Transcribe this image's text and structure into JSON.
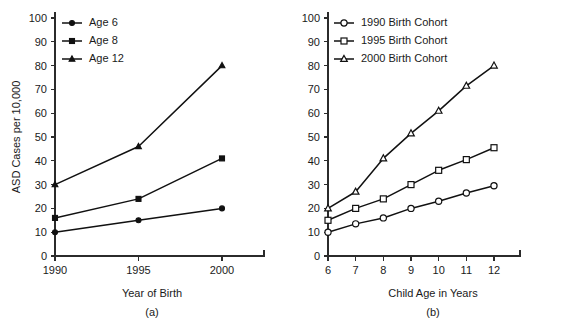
{
  "figure": {
    "background_color": "#ffffff",
    "ink_color": "#111111"
  },
  "chart_data": [
    {
      "type": "line",
      "panel": "a",
      "caption": "(a)",
      "title": "",
      "xlabel": "Year of Birth",
      "ylabel": "ASD Cases per 10,000",
      "x": [
        1990,
        1995,
        2000
      ],
      "categories": [
        "1990",
        "1995",
        "2000"
      ],
      "xtick_labels": [
        "1990",
        "1995",
        "2000"
      ],
      "ytick_labels": [
        "0",
        "10",
        "20",
        "30",
        "40",
        "50",
        "60",
        "70",
        "80",
        "90",
        "100"
      ],
      "ylim": [
        0,
        100
      ],
      "ytick_step": 10,
      "grid": false,
      "legend_position": "top-left",
      "series": [
        {
          "name": "Age 6",
          "marker": "filled-circle",
          "values": [
            10,
            15,
            20
          ]
        },
        {
          "name": "Age 8",
          "marker": "filled-square",
          "values": [
            16,
            24,
            41
          ]
        },
        {
          "name": "Age 12",
          "marker": "filled-triangle",
          "values": [
            30,
            46,
            80
          ]
        }
      ]
    },
    {
      "type": "line",
      "panel": "b",
      "caption": "(b)",
      "title": "",
      "xlabel": "Child Age in Years",
      "ylabel": "ASD Cases per 10,000",
      "x": [
        6,
        7,
        8,
        9,
        10,
        11,
        12
      ],
      "categories": [
        "6",
        "7",
        "8",
        "9",
        "10",
        "11",
        "12"
      ],
      "xtick_labels": [
        "6",
        "7",
        "8",
        "9",
        "10",
        "11",
        "12"
      ],
      "ytick_labels": [
        "0",
        "10",
        "20",
        "30",
        "40",
        "50",
        "60",
        "70",
        "80",
        "90",
        "100"
      ],
      "ylim": [
        0,
        100
      ],
      "ytick_step": 10,
      "grid": false,
      "legend_position": "top-left",
      "series": [
        {
          "name": "1990 Birth Cohort",
          "marker": "open-circle",
          "values": [
            10,
            13.5,
            16,
            20,
            23,
            26.5,
            29.5
          ]
        },
        {
          "name": "1995 Birth Cohort",
          "marker": "open-square",
          "values": [
            15,
            20,
            24,
            30,
            36,
            40.5,
            45.5
          ]
        },
        {
          "name": "2000 Birth Cohort",
          "marker": "open-triangle",
          "values": [
            20,
            27,
            41,
            51.5,
            61,
            71.5,
            80
          ]
        }
      ]
    }
  ]
}
